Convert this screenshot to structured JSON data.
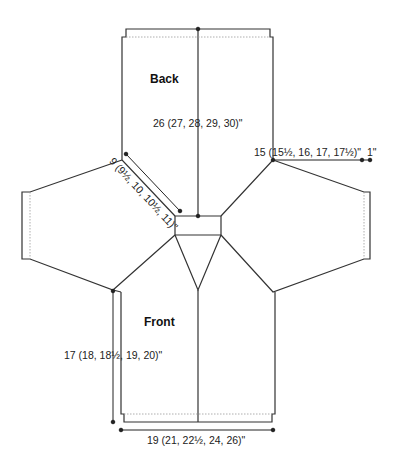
{
  "pieces": {
    "back": "Back",
    "front": "Front"
  },
  "measurements": {
    "length": "26 (27, 28, 29, 30)\"",
    "raglan": "9 (9½, 10, 10½, 11)\"",
    "sleeve_width": "15 (15½, 16, 17, 17½)\"",
    "cuff": "1\"",
    "front_length": "17 (18, 18½, 19, 20)\"",
    "width": "19 (21, 22½, 24, 26)\""
  },
  "colors": {
    "line": "#333333",
    "dotted": "#999999",
    "text": "#222222"
  }
}
